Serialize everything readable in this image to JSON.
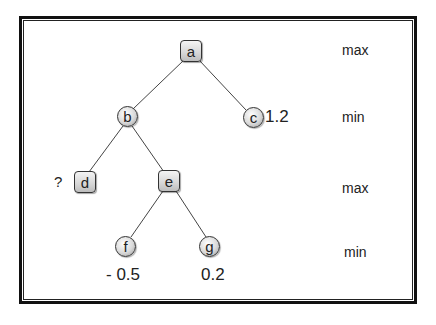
{
  "diagram": {
    "type": "minimax game tree",
    "nodes": [
      {
        "id": "a",
        "label": "a",
        "shape": "square",
        "level": 0,
        "value": null
      },
      {
        "id": "b",
        "label": "b",
        "shape": "circle",
        "level": 1,
        "value": null
      },
      {
        "id": "c",
        "label": "c",
        "shape": "circle",
        "level": 1,
        "value": "1.2"
      },
      {
        "id": "d",
        "label": "d",
        "shape": "square",
        "level": 2,
        "value": "?"
      },
      {
        "id": "e",
        "label": "e",
        "shape": "square",
        "level": 2,
        "value": null
      },
      {
        "id": "f",
        "label": "f",
        "shape": "circle",
        "level": 3,
        "value": "- 0.5"
      },
      {
        "id": "g",
        "label": "g",
        "shape": "circle",
        "level": 3,
        "value": "0.2"
      }
    ],
    "edges": [
      [
        "a",
        "b"
      ],
      [
        "a",
        "c"
      ],
      [
        "b",
        "d"
      ],
      [
        "b",
        "e"
      ],
      [
        "e",
        "f"
      ],
      [
        "e",
        "g"
      ]
    ],
    "levels": [
      "max",
      "min",
      "max",
      "min"
    ]
  },
  "labels": {
    "a": "a",
    "b": "b",
    "c": "c",
    "d": "d",
    "e": "e",
    "f": "f",
    "g": "g",
    "c_value": "1.2",
    "d_value": "?",
    "f_value": "- 0.5",
    "g_value": "0.2",
    "level0": "max",
    "level1": "min",
    "level2": "max",
    "level3": "min"
  }
}
